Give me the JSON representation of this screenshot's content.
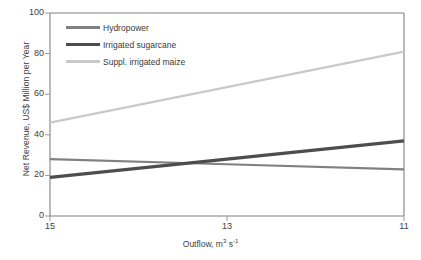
{
  "chart_data": {
    "type": "line",
    "title": "",
    "xlabel": "Outflow, m³ s⁻¹",
    "xlabel_parts": {
      "text": "Outflow, m",
      "sup1": "3",
      "mid": " s",
      "sup2": "-1"
    },
    "ylabel": "Net Revenue, US$ Million per Year",
    "x": [
      15,
      13,
      11
    ],
    "xtick_labels": [
      "15",
      "13",
      "11"
    ],
    "ytick_labels": [
      "0",
      "20",
      "40",
      "60",
      "80",
      "100"
    ],
    "xlim": [
      15,
      11
    ],
    "ylim": [
      0,
      100
    ],
    "x_axis_reversed": true,
    "grid": false,
    "legend_position": "top-left-inside",
    "series": [
      {
        "name": "Hydropower",
        "values": [
          28,
          25.5,
          23
        ],
        "color": "#808080",
        "width": 2.2
      },
      {
        "name": "Irrigated sugarcane",
        "values": [
          19,
          28,
          37
        ],
        "color": "#4d4d4d",
        "width": 3.4
      },
      {
        "name": "Suppl. irrigated maize",
        "values": [
          46,
          63.5,
          81
        ],
        "color": "#c9c9c9",
        "width": 2.2
      }
    ]
  },
  "axes": {
    "frame_color": "#808080",
    "tick_color": "#9a9a9a",
    "text_color": "#404040"
  }
}
